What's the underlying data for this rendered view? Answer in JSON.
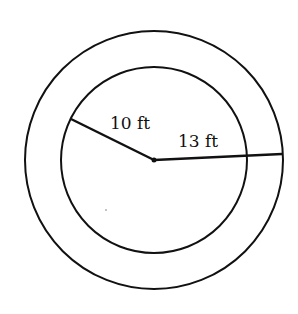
{
  "diagram": {
    "type": "concentric-circles",
    "outer_circle": {
      "radius_label": "13 ft",
      "radius_value": 13,
      "unit": "ft"
    },
    "inner_circle": {
      "radius_label": "10 ft",
      "radius_value": 10,
      "unit": "ft"
    },
    "colors": {
      "stroke": "#111111",
      "background": "#ffffff"
    }
  }
}
